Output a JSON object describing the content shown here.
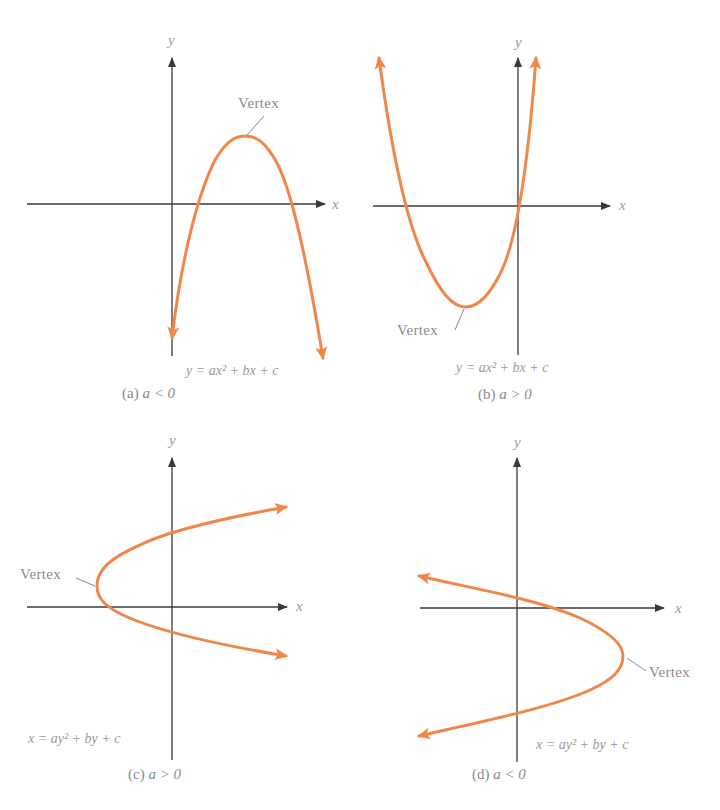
{
  "figure": {
    "curve_color": "#f0874a",
    "axis_color": "#3a3a3a",
    "text_color": "#8a8a8a"
  },
  "panels": [
    {
      "id": "a",
      "axis_x_label": "x",
      "axis_y_label": "y",
      "vertex_label": "Vertex",
      "equation": "y = ax² + bx + c",
      "caption_letter": "(a)",
      "caption_condition": "a < 0",
      "opens": "down"
    },
    {
      "id": "b",
      "axis_x_label": "x",
      "axis_y_label": "y",
      "vertex_label": "Vertex",
      "equation": "y = ax² + bx + c",
      "caption_letter": "(b)",
      "caption_condition": "a > 0",
      "opens": "up"
    },
    {
      "id": "c",
      "axis_x_label": "x",
      "axis_y_label": "y",
      "vertex_label": "Vertex",
      "equation": "x = ay² + by + c",
      "caption_letter": "(c)",
      "caption_condition": "a > 0",
      "opens": "right"
    },
    {
      "id": "d",
      "axis_x_label": "x",
      "axis_y_label": "y",
      "vertex_label": "Vertex",
      "equation": "x = ay² + by + c",
      "caption_letter": "(d)",
      "caption_condition": "a < 0",
      "opens": "left"
    }
  ]
}
